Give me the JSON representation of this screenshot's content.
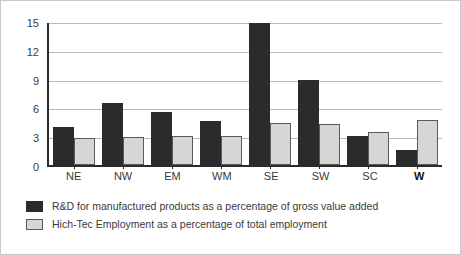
{
  "chart_data": {
    "type": "bar",
    "title": "",
    "xlabel": "",
    "ylabel": "",
    "ylim": [
      0,
      15
    ],
    "yticks": [
      0,
      3,
      6,
      9,
      12,
      15
    ],
    "grid": true,
    "legend_position": "below-plot",
    "categories": [
      "NE",
      "NW",
      "EM",
      "WM",
      "SE",
      "SW",
      "SC",
      "W"
    ],
    "emphasized_categories": [
      "W"
    ],
    "series": [
      {
        "name": "R&D for manufactured products as a percentage of gross value added",
        "color": "#2b2b2b",
        "values": [
          4.0,
          6.6,
          5.6,
          4.6,
          15.0,
          9.0,
          3.1,
          1.6
        ]
      },
      {
        "name": "Hich-Tec Employment as a percentage of total employment",
        "color": "#d6d6d6",
        "values": [
          2.9,
          3.0,
          3.1,
          3.1,
          4.4,
          4.3,
          3.5,
          4.8
        ]
      }
    ]
  },
  "legend": {
    "items": [
      {
        "swatch": "dark",
        "label": "R&D for manufactured products as a percentage of gross value added"
      },
      {
        "swatch": "light",
        "label": "Hich-Tec Employment as a percentage of total employment"
      }
    ]
  }
}
